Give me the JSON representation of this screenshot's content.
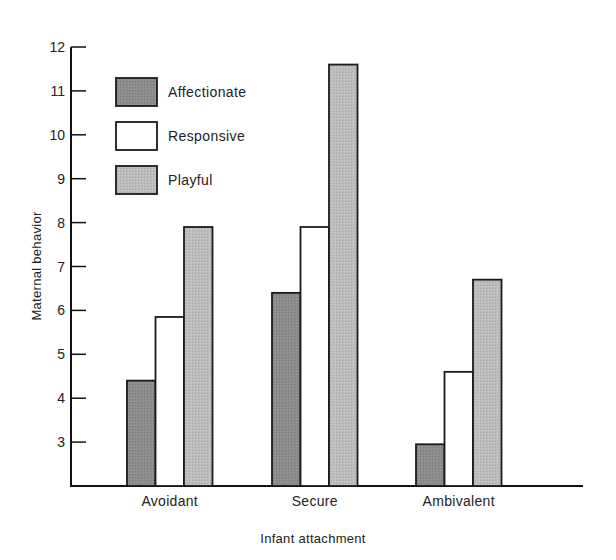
{
  "chart_data": {
    "type": "bar",
    "title": "",
    "xlabel": "Infant attachment",
    "ylabel": "Maternal behavior",
    "ylim": [
      2,
      12
    ],
    "yticks": [
      3,
      4,
      5,
      6,
      7,
      8,
      9,
      10,
      11,
      12
    ],
    "grid": false,
    "legend_position": "top-left",
    "categories": [
      "Avoidant",
      "Secure",
      "Ambivalent"
    ],
    "series": [
      {
        "name": "Affectionate",
        "color": "#8c8c8c",
        "values": [
          4.4,
          6.4,
          2.95
        ]
      },
      {
        "name": "Responsive",
        "color": "#ffffff",
        "values": [
          5.85,
          7.9,
          4.6
        ]
      },
      {
        "name": "Playful",
        "color": "#bcbcbc",
        "values": [
          7.9,
          11.6,
          6.7
        ]
      }
    ]
  }
}
